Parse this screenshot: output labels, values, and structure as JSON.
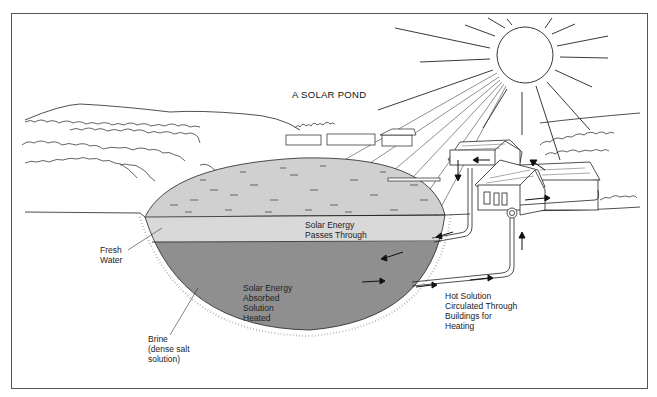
{
  "diagram": {
    "title": "A SOLAR POND",
    "colors": {
      "frame": "#555555",
      "line": "#222222",
      "fresh_water": "#d9d9d9",
      "surface_water": "#d0d0d0",
      "brine": "#8f8f8f",
      "background": "#ffffff"
    },
    "labels": {
      "solar_passes": [
        "Solar Energy",
        "Passes Through"
      ],
      "solar_absorbed": [
        "Solar Energy",
        "Absorbed",
        "Solution",
        "Heated"
      ],
      "fresh_water": [
        "Fresh",
        "Water"
      ],
      "brine": [
        "Brine",
        "(dense salt",
        "solution)"
      ],
      "hot_solution": [
        "Hot Solution",
        "Circulated Through",
        "Buildings for",
        "Heating"
      ]
    },
    "elements": {
      "sun": "sun-with-rays",
      "layers": [
        "fresh water (upper, light gray)",
        "brine (lower, dark gray)"
      ],
      "buildings": [
        "distant row houses (3)",
        "house near pond",
        "main house with pipe loop"
      ],
      "flow": [
        "pipe from brine to buildings",
        "return pipe into brine",
        "flow arrows"
      ]
    }
  }
}
